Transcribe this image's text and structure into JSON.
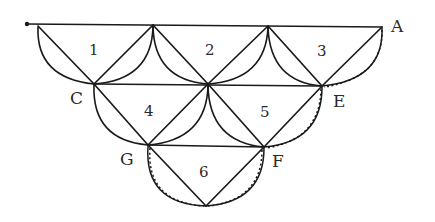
{
  "diagram": {
    "type": "truss-network of triangles with arcs",
    "point_labels": {
      "A": "A",
      "C": "C",
      "E": "E",
      "F": "F",
      "G": "G"
    },
    "region_labels": [
      "1",
      "2",
      "3",
      "4",
      "5",
      "6"
    ],
    "colors": {
      "stroke": "#1a1a1a",
      "text": "#2a2a2a",
      "background": "#ffffff"
    }
  }
}
